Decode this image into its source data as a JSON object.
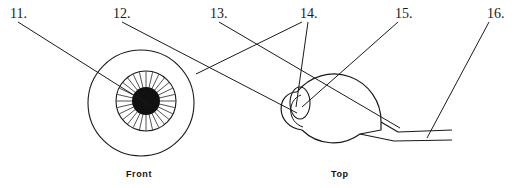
{
  "figure": {
    "background_color": "#ffffff",
    "ink_color": "#1a1a1a",
    "pupil_fill": "#111111"
  },
  "callouts": [
    {
      "id": "11",
      "label": "11.",
      "x": 10,
      "y": 7
    },
    {
      "id": "12",
      "label": "12.",
      "x": 113,
      "y": 7
    },
    {
      "id": "13",
      "label": "13.",
      "x": 210,
      "y": 7
    },
    {
      "id": "14",
      "label": "14.",
      "x": 300,
      "y": 7
    },
    {
      "id": "15",
      "label": "15.",
      "x": 395,
      "y": 7
    },
    {
      "id": "16",
      "label": "16.",
      "x": 487,
      "y": 7
    }
  ],
  "views": [
    {
      "id": "front",
      "caption": "Front",
      "caption_x": 126,
      "caption_y": 170
    },
    {
      "id": "top",
      "caption": "Top",
      "caption_x": 331,
      "caption_y": 170
    }
  ],
  "front_view": {
    "eyeball_cx": 141,
    "eyeball_cy": 103,
    "eyeball_r": 53,
    "iris_cx": 146,
    "iris_cy": 101,
    "iris_r": 30,
    "pupil_cx": 146,
    "pupil_cy": 101,
    "pupil_r": 14,
    "iris_spokes": 28
  },
  "top_view": {
    "eyeball_cx": 337,
    "eyeball_cy": 108,
    "eyeball_r": 47,
    "cornea_cx": 294,
    "cornea_cy": 108,
    "lens_cx": 300,
    "lens_cy": 103,
    "lens_rx": 10,
    "lens_ry": 16,
    "optic_nerve_label": "optic-nerve"
  },
  "leader_lines": [
    {
      "id": "leader-11",
      "from": "11",
      "x1": 18,
      "y1": 22,
      "x2": 151,
      "y2": 106
    },
    {
      "id": "leader-12",
      "from": "12",
      "x1": 122,
      "y1": 22,
      "x2": 297,
      "y2": 113
    },
    {
      "id": "leader-13",
      "from": "13",
      "x1": 219,
      "y1": 22,
      "x2": 400,
      "y2": 128
    },
    {
      "id": "leader-14a",
      "from": "14",
      "x1": 302,
      "y1": 22,
      "x2": 196,
      "y2": 74
    },
    {
      "id": "leader-14b",
      "from": "14",
      "x1": 308,
      "y1": 22,
      "x2": 296,
      "y2": 107
    },
    {
      "id": "leader-15",
      "from": "15",
      "x1": 398,
      "y1": 22,
      "x2": 302,
      "y2": 107
    },
    {
      "id": "leader-16",
      "from": "16",
      "x1": 489,
      "y1": 22,
      "x2": 427,
      "y2": 138
    }
  ]
}
